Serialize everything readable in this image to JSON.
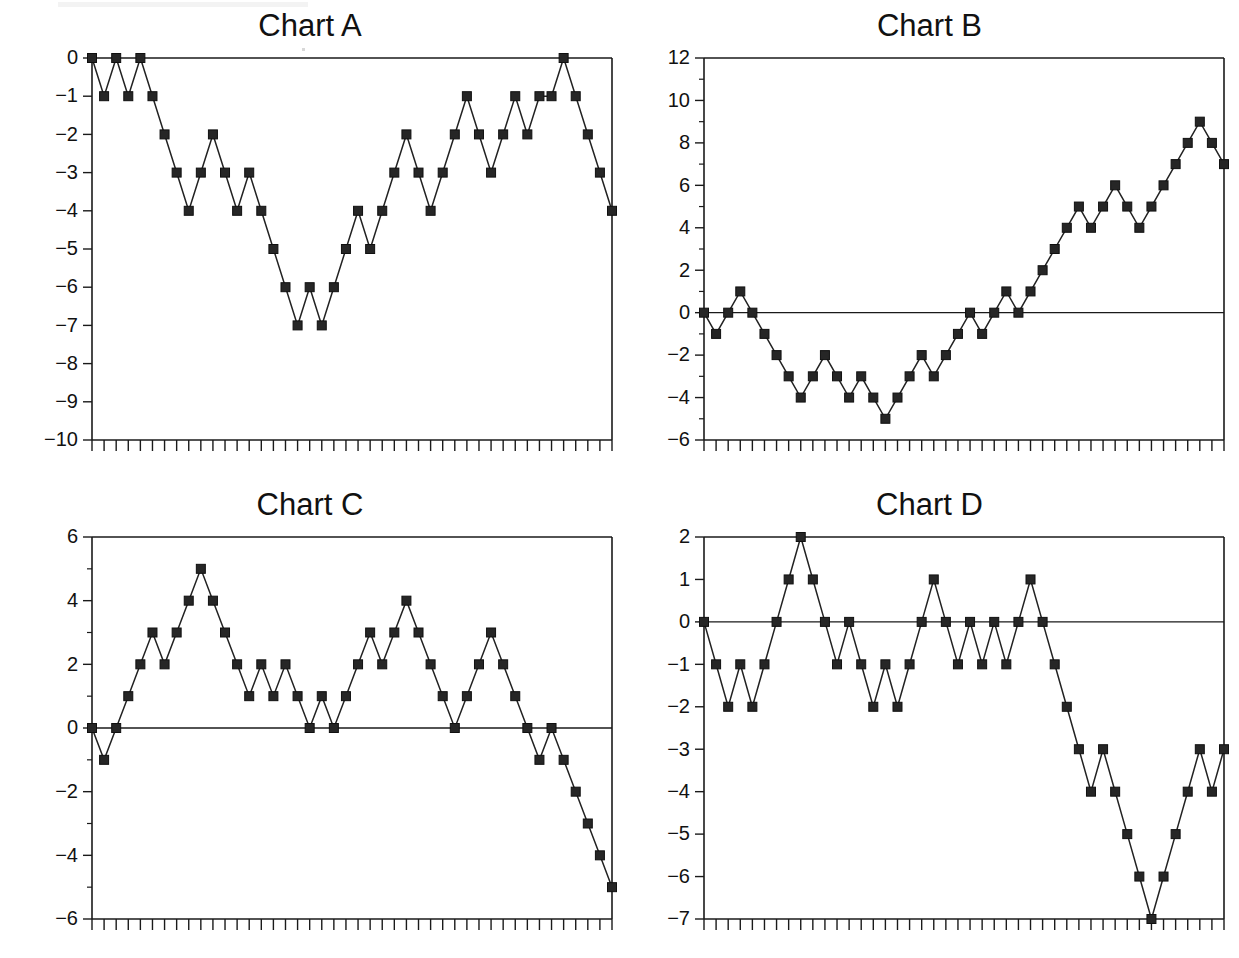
{
  "figure": {
    "background_color": "#ffffff",
    "line_color": "#222222",
    "marker_color": "#262626",
    "panel_count": 4
  },
  "panels": [
    {
      "id": "chart-a",
      "title": "Chart A"
    },
    {
      "id": "chart-b",
      "title": "Chart B"
    },
    {
      "id": "chart-c",
      "title": "Chart C"
    },
    {
      "id": "chart-d",
      "title": "Chart D"
    }
  ],
  "chart_data": [
    {
      "type": "line",
      "title": "Chart A",
      "xlabel": "",
      "ylabel": "",
      "xlim": [
        0,
        43
      ],
      "ylim": [
        -10,
        0
      ],
      "grid": false,
      "legend": "none",
      "marker": "square",
      "ytick_labels": [
        "0",
        "-1",
        "-2",
        "-3",
        "-4",
        "-5",
        "-6",
        "-7",
        "-8",
        "-9",
        "-10"
      ],
      "yticks": [
        0,
        -1,
        -2,
        -3,
        -4,
        -5,
        -6,
        -7,
        -8,
        -9,
        -10
      ],
      "x": [
        0,
        1,
        2,
        3,
        4,
        5,
        6,
        7,
        8,
        9,
        10,
        11,
        12,
        13,
        14,
        15,
        16,
        17,
        18,
        19,
        20,
        21,
        22,
        23,
        24,
        25,
        26,
        27,
        28,
        29,
        30,
        31,
        32,
        33,
        34,
        35,
        36,
        37,
        38,
        39,
        40,
        41,
        42,
        43
      ],
      "values": [
        0,
        -1,
        0,
        -1,
        0,
        -1,
        -2,
        -3,
        -4,
        -3,
        -2,
        -3,
        -4,
        -3,
        -4,
        -5,
        -6,
        -7,
        -6,
        -7,
        -6,
        -5,
        -4,
        -5,
        -4,
        -3,
        -2,
        -3,
        -4,
        -3,
        -2,
        -1,
        -2,
        -3,
        -2,
        -1,
        -2,
        -1,
        -1,
        0,
        -1,
        -2,
        -3,
        -4
      ]
    },
    {
      "type": "line",
      "title": "Chart B",
      "xlabel": "",
      "ylabel": "",
      "xlim": [
        0,
        43
      ],
      "ylim": [
        -6,
        12
      ],
      "grid": false,
      "legend": "none",
      "marker": "square",
      "ytick_labels": [
        "12",
        "10",
        "8",
        "6",
        "4",
        "2",
        "0",
        "-2",
        "-4",
        "-6"
      ],
      "yticks": [
        12,
        10,
        8,
        6,
        4,
        2,
        0,
        -2,
        -4,
        -6
      ],
      "x": [
        0,
        1,
        2,
        3,
        4,
        5,
        6,
        7,
        8,
        9,
        10,
        11,
        12,
        13,
        14,
        15,
        16,
        17,
        18,
        19,
        20,
        21,
        22,
        23,
        24,
        25,
        26,
        27,
        28,
        29,
        30,
        31,
        32,
        33,
        34,
        35,
        36,
        37,
        38,
        39,
        40,
        41,
        42,
        43
      ],
      "values": [
        0,
        -1,
        0,
        1,
        0,
        -1,
        -2,
        -3,
        -4,
        -3,
        -2,
        -3,
        -4,
        -3,
        -4,
        -5,
        -4,
        -3,
        -2,
        -3,
        -2,
        -1,
        0,
        -1,
        0,
        1,
        0,
        1,
        2,
        3,
        4,
        5,
        4,
        5,
        6,
        5,
        4,
        5,
        6,
        7,
        8,
        9,
        8,
        7
      ]
    },
    {
      "type": "line",
      "title": "Chart C",
      "xlabel": "",
      "ylabel": "",
      "xlim": [
        0,
        43
      ],
      "ylim": [
        -6,
        6
      ],
      "grid": false,
      "legend": "none",
      "marker": "square",
      "ytick_labels": [
        "6",
        "4",
        "2",
        "0",
        "-2",
        "-4",
        "-6"
      ],
      "yticks": [
        6,
        4,
        2,
        0,
        -2,
        -4,
        -6
      ],
      "x": [
        0,
        1,
        2,
        3,
        4,
        5,
        6,
        7,
        8,
        9,
        10,
        11,
        12,
        13,
        14,
        15,
        16,
        17,
        18,
        19,
        20,
        21,
        22,
        23,
        24,
        25,
        26,
        27,
        28,
        29,
        30,
        31,
        32,
        33,
        34,
        35,
        36,
        37,
        38,
        39,
        40,
        41,
        42,
        43
      ],
      "values": [
        0,
        -1,
        0,
        1,
        2,
        3,
        2,
        3,
        4,
        5,
        4,
        3,
        2,
        1,
        2,
        1,
        2,
        1,
        0,
        1,
        0,
        1,
        2,
        3,
        2,
        3,
        4,
        3,
        2,
        1,
        0,
        1,
        2,
        3,
        2,
        1,
        0,
        -1,
        0,
        -1,
        -2,
        -3,
        -4,
        -5
      ]
    },
    {
      "type": "line",
      "title": "Chart D",
      "xlabel": "",
      "ylabel": "",
      "xlim": [
        0,
        43
      ],
      "ylim": [
        -7,
        2
      ],
      "grid": false,
      "legend": "none",
      "marker": "square",
      "ytick_labels": [
        "2",
        "1",
        "0",
        "-1",
        "-2",
        "-3",
        "-4",
        "-5",
        "-6",
        "-7"
      ],
      "yticks": [
        2,
        1,
        0,
        -1,
        -2,
        -3,
        -4,
        -5,
        -6,
        -7
      ],
      "x": [
        0,
        1,
        2,
        3,
        4,
        5,
        6,
        7,
        8,
        9,
        10,
        11,
        12,
        13,
        14,
        15,
        16,
        17,
        18,
        19,
        20,
        21,
        22,
        23,
        24,
        25,
        26,
        27,
        28,
        29,
        30,
        31,
        32,
        33,
        34,
        35,
        36,
        37,
        38,
        39,
        40,
        41,
        42,
        43
      ],
      "values": [
        0,
        -1,
        -2,
        -1,
        -2,
        -1,
        0,
        1,
        2,
        1,
        0,
        -1,
        0,
        -1,
        -2,
        -1,
        -2,
        -1,
        0,
        1,
        0,
        -1,
        0,
        -1,
        0,
        -1,
        0,
        1,
        0,
        -1,
        -2,
        -3,
        -4,
        -3,
        -4,
        -5,
        -6,
        -7,
        -6,
        -5,
        -4,
        -3,
        -4,
        -3
      ]
    }
  ]
}
